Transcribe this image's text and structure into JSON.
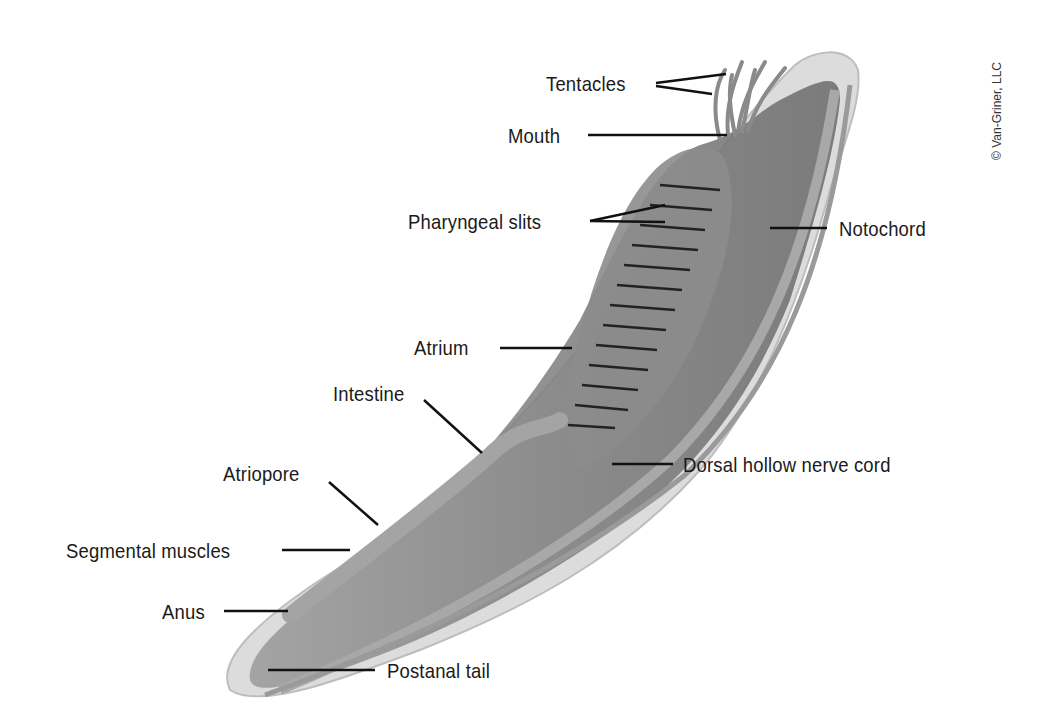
{
  "credit": "© Van-Griner, LLC",
  "labels": {
    "tentacles": "Tentacles",
    "mouth": "Mouth",
    "pharyngeal_slits": "Pharyngeal slits",
    "notochord": "Notochord",
    "atrium": "Atrium",
    "intestine": "Intestine",
    "atriopore": "Atriopore",
    "dorsal_nerve_cord": "Dorsal hollow nerve cord",
    "segmental_muscles": "Segmental muscles",
    "anus": "Anus",
    "postanal_tail": "Postanal tail"
  },
  "colors": {
    "body": "#8a8a8a",
    "skin": "#d8d8d8",
    "dark": "#555555",
    "line": "#111111"
  }
}
